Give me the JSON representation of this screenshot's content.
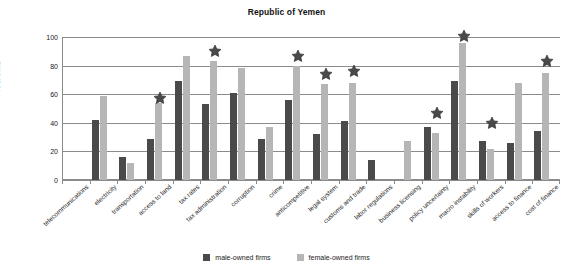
{
  "chart_data": {
    "type": "bar",
    "title": "Republic of Yemen",
    "xlabel": "",
    "ylabel": "% of firms",
    "ylim": [
      0,
      100
    ],
    "yticks": [
      0,
      20,
      40,
      60,
      80,
      100
    ],
    "grid": true,
    "legend_position": "bottom",
    "categories": [
      "telecommunications",
      "electricity",
      "transportation",
      "access to land",
      "tax rates",
      "tax administration",
      "corruption",
      "crime",
      "anticompetitive",
      "legal system",
      "customs and trade",
      "labor regulations",
      "business licensing",
      "policy uncertainty",
      "macro instability",
      "skills of workers",
      "access to finance",
      "cost of finance"
    ],
    "series": [
      {
        "name": "male-owned firms",
        "color": "#4a4a4a",
        "values": [
          0,
          42,
          16,
          29,
          69,
          53,
          61,
          29,
          56,
          32,
          41,
          14,
          0,
          37,
          69,
          27,
          26,
          34
        ]
      },
      {
        "name": "female-owned firms",
        "color": "#b6b6b6",
        "values": [
          0,
          59,
          12,
          54,
          87,
          83,
          78,
          37,
          80,
          67,
          68,
          0,
          27,
          33,
          96,
          22,
          68,
          75
        ]
      }
    ],
    "annotations": {
      "marker": "star",
      "meaning": "statistically significant difference",
      "categories": [
        "access to land",
        "tax administration",
        "anticompetitive",
        "legal system",
        "customs and trade",
        "policy uncertainty",
        "macro instability",
        "skills of workers",
        "cost of finance"
      ],
      "values": [
        57,
        90,
        87,
        74,
        76,
        47,
        101,
        40,
        83
      ]
    }
  },
  "legend": {
    "items": [
      {
        "label": "male-owned firms",
        "color": "#4a4a4a"
      },
      {
        "label": "female-owned firms",
        "color": "#b6b6b6"
      }
    ]
  }
}
